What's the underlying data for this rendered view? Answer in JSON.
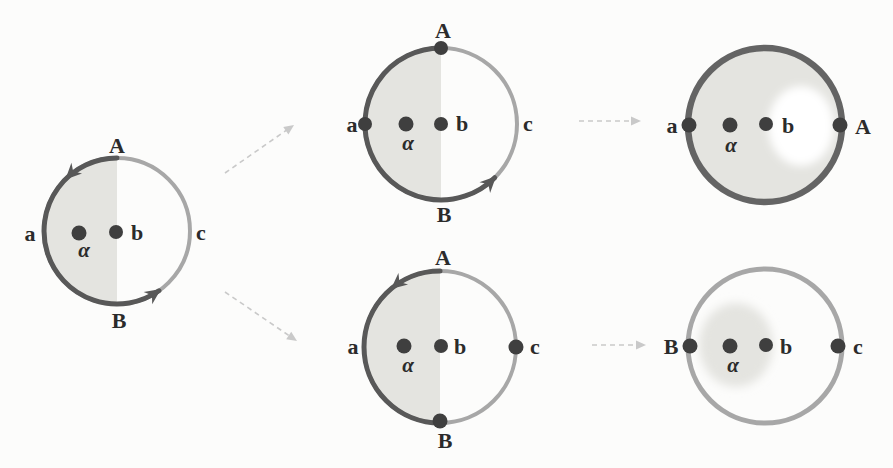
{
  "colors": {
    "bg": "#fcfcfb",
    "ink": "#2b2b2b",
    "dark": "#585858",
    "ring-dark": "#646464",
    "light": "#a7a7a7",
    "shade": "#e4e4e0",
    "dot": "#3f3f3f",
    "faint": "#c9c9c9"
  },
  "figure": {
    "panels": {
      "initial": {
        "labels": {
          "top": "A",
          "bottom": "B",
          "left": "a",
          "center": "b",
          "right": "c",
          "interior": "α"
        }
      },
      "top_middle": {
        "labels": {
          "top": "A",
          "bottom": "B",
          "left": "a",
          "center": "b",
          "right": "c",
          "interior": "α"
        }
      },
      "top_right": {
        "labels": {
          "left": "a",
          "interior": "α",
          "center": "b",
          "right": "A"
        }
      },
      "bottom_middle": {
        "labels": {
          "top": "A",
          "bottom": "B",
          "left": "a",
          "center": "b",
          "right": "c",
          "interior": "α"
        }
      },
      "bottom_right": {
        "labels": {
          "left": "B",
          "interior": "α",
          "center": "b",
          "right": "c"
        }
      }
    }
  }
}
